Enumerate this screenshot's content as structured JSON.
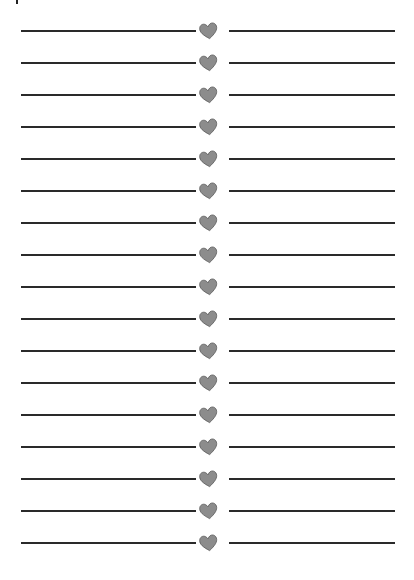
{
  "page": {
    "background": "#ffffff",
    "line_color": "#2a2a2a",
    "heart_color": "#8c8c8c",
    "heart_outline": "#5a5a5a",
    "row_count": 17,
    "first_line_y": 31,
    "row_spacing": 32
  },
  "rows": [
    {
      "icon": "heart-icon"
    },
    {
      "icon": "heart-icon"
    },
    {
      "icon": "heart-icon"
    },
    {
      "icon": "heart-icon"
    },
    {
      "icon": "heart-icon"
    },
    {
      "icon": "heart-icon"
    },
    {
      "icon": "heart-icon"
    },
    {
      "icon": "heart-icon"
    },
    {
      "icon": "heart-icon"
    },
    {
      "icon": "heart-icon"
    },
    {
      "icon": "heart-icon"
    },
    {
      "icon": "heart-icon"
    },
    {
      "icon": "heart-icon"
    },
    {
      "icon": "heart-icon"
    },
    {
      "icon": "heart-icon"
    },
    {
      "icon": "heart-icon"
    },
    {
      "icon": "heart-icon"
    }
  ]
}
